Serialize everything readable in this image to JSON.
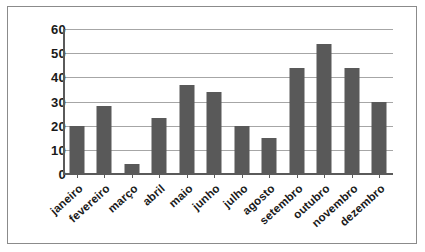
{
  "chart_data": {
    "type": "bar",
    "title": "",
    "subtitle": "",
    "xlabel": "",
    "ylabel": "",
    "categories": [
      "janeiro",
      "fevereiro",
      "março",
      "abril",
      "maio",
      "junho",
      "julho",
      "agosto",
      "setembro",
      "outubro",
      "novembro",
      "dezembro"
    ],
    "values": [
      20,
      28,
      4,
      23,
      37,
      34,
      20,
      15,
      44,
      54,
      44,
      30
    ],
    "ylim": [
      0,
      60
    ],
    "ytick_step": 10,
    "yticks": [
      "0",
      "10",
      "20",
      "30",
      "40",
      "50",
      "60"
    ],
    "ytick_values": [
      0,
      10,
      20,
      30,
      40,
      50,
      60
    ],
    "grid": true,
    "grid_axis": "y",
    "legend": false,
    "legend_position": "none",
    "bar_color": "#595959",
    "gridline_color": "#a6a6a6",
    "axis_color": "#5a5a5a",
    "frame_color": "#8b8b8b",
    "text_color": "#1a1a1a",
    "xlabel_rotation": -42
  }
}
